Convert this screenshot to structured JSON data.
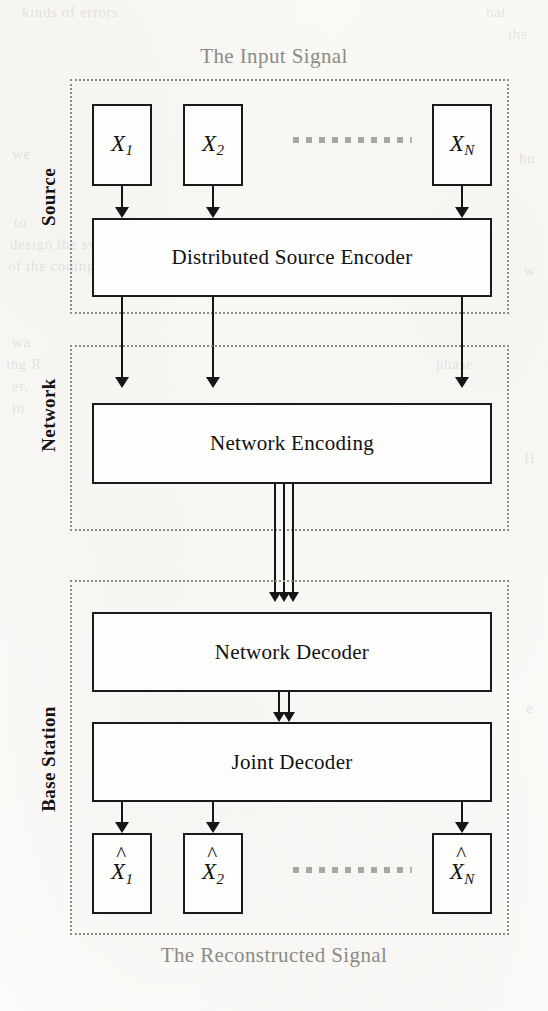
{
  "figure": {
    "top_caption": "The Input Signal",
    "bottom_caption": "The Reconstructed Signal",
    "colors": {
      "paper": "#fbfbf9",
      "ink": "#161616",
      "dotted_border": "#8d8d88",
      "caption_gray": "#8b8b86",
      "ellipsis_gray": "#a7a7a2"
    }
  },
  "regions": [
    {
      "id": "source",
      "label": "Source"
    },
    {
      "id": "network",
      "label": "Network"
    },
    {
      "id": "base_station",
      "label": "Base Station"
    }
  ],
  "source_nodes": [
    {
      "base": "X",
      "sub": "1"
    },
    {
      "base": "X",
      "sub": "2"
    },
    {
      "base": "X",
      "sub": "N"
    }
  ],
  "reconstructed_nodes": [
    {
      "hat": "^",
      "base": "X",
      "sub": "1"
    },
    {
      "hat": "^",
      "base": "X",
      "sub": "2"
    },
    {
      "hat": "^",
      "base": "X",
      "sub": "N"
    }
  ],
  "blocks": {
    "distributed_source_encoder": "Distributed Source Encoder",
    "network_encoding": "Network Encoding",
    "network_decoder": "Network Decoder",
    "joint_decoder": "Joint Decoder"
  },
  "ghost_text": [
    {
      "t": "kinds of errors",
      "x": 22,
      "y": 4
    },
    {
      "t": "nal",
      "x": 486,
      "y": 4
    },
    {
      "t": "the",
      "x": 508,
      "y": 26
    },
    {
      "t": "we",
      "x": 12,
      "y": 146
    },
    {
      "t": "hu",
      "x": 519,
      "y": 150
    },
    {
      "t": "to",
      "x": 14,
      "y": 214
    },
    {
      "t": "design the symbol",
      "x": 10,
      "y": 236
    },
    {
      "t": "of the coding scheme",
      "x": 8,
      "y": 258
    },
    {
      "t": "w",
      "x": 524,
      "y": 262
    },
    {
      "t": "wa",
      "x": 12,
      "y": 334
    },
    {
      "t": "ing R",
      "x": 6,
      "y": 356
    },
    {
      "t": "er,",
      "x": 12,
      "y": 378
    },
    {
      "t": "in",
      "x": 12,
      "y": 400
    },
    {
      "t": "phase",
      "x": 436,
      "y": 356
    },
    {
      "t": "H",
      "x": 524,
      "y": 450
    },
    {
      "t": "e",
      "x": 526,
      "y": 700
    }
  ]
}
